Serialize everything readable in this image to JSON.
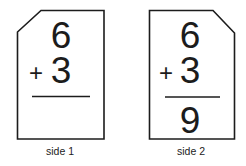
{
  "cards": [
    {
      "id": "side-1",
      "label": "side 1",
      "top_number": "6",
      "operator": "+",
      "bottom_number": "3",
      "answer": ""
    },
    {
      "id": "side-2",
      "label": "side 2",
      "top_number": "6",
      "operator": "+",
      "bottom_number": "3",
      "answer": "9"
    }
  ],
  "colors": {
    "ink": "#1c1c1c",
    "background": "#ffffff"
  }
}
